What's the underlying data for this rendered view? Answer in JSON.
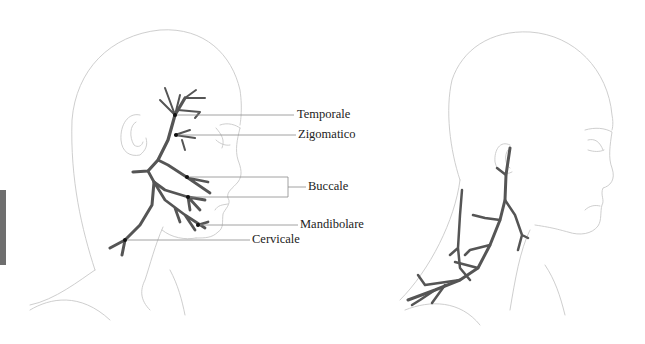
{
  "figure": {
    "left_panel": {
      "description": "Facial nerve branches (lateral view)",
      "labels": [
        {
          "id": "temporale",
          "text": "Temporale"
        },
        {
          "id": "zigomatico",
          "text": "Zigomatico"
        },
        {
          "id": "buccale",
          "text": "Buccale"
        },
        {
          "id": "mandibolare",
          "text": "Mandibolare"
        },
        {
          "id": "cervicale",
          "text": "Cervicale"
        }
      ]
    },
    "right_panel": {
      "description": "Cervical plexus / neck nerve branching (lateral view)"
    },
    "colors": {
      "nerve": "#555555",
      "outline": "#c8c8c8",
      "leader": "#8a8a8a",
      "side_tab": "#6e6e6e"
    }
  }
}
